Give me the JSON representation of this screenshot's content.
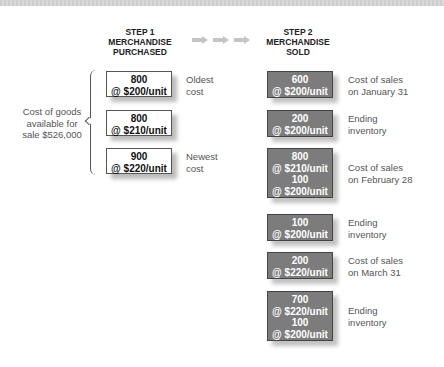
{
  "steps": {
    "step1": {
      "line1": "STEP 1",
      "line2": "MERCHANDISE",
      "line3": "PURCHASED"
    },
    "step2": {
      "line1": "STEP 2",
      "line2": "MERCHANDISE",
      "line3": "SOLD"
    }
  },
  "arrows": [
    "arrow-icon",
    "arrow-icon",
    "arrow-icon"
  ],
  "available": {
    "line1": "Cost of goods",
    "line2": "available for",
    "line3": "sale $526,000"
  },
  "purchased": [
    {
      "qty": "800",
      "price": "@ $200/unit",
      "note1": "Oldest",
      "note2": "cost"
    },
    {
      "qty": "800",
      "price": "@ $210/unit",
      "note1": "",
      "note2": ""
    },
    {
      "qty": "900",
      "price": "@ $220/unit",
      "note1": "Newest",
      "note2": "cost"
    }
  ],
  "sold": [
    {
      "lines": [
        "600",
        "@ $200/unit"
      ],
      "note1": "Cost of sales",
      "note2": "on January 31"
    },
    {
      "lines": [
        "200",
        "@ $200/unit"
      ],
      "note1": "Ending",
      "note2": "inventory"
    },
    {
      "lines": [
        "800",
        "@ $210/unit",
        "100",
        "@ $200/unit"
      ],
      "note1": "Cost of sales",
      "note2": "on February 28"
    },
    {
      "lines": [
        "100",
        "@ $200/unit"
      ],
      "note1": "Ending",
      "note2": "inventory"
    },
    {
      "lines": [
        "200",
        "@ $220/unit"
      ],
      "note1": "Cost of sales",
      "note2": "on March 31"
    },
    {
      "lines": [
        "700",
        "@ $220/unit",
        "100",
        "@ $200/unit"
      ],
      "note1": "Ending",
      "note2": "inventory"
    }
  ],
  "colors": {
    "sold_box": "#7c7c7c",
    "purchased_box": "#ffffff",
    "arrow": "#c4c4c4",
    "label_text": "#555555"
  }
}
